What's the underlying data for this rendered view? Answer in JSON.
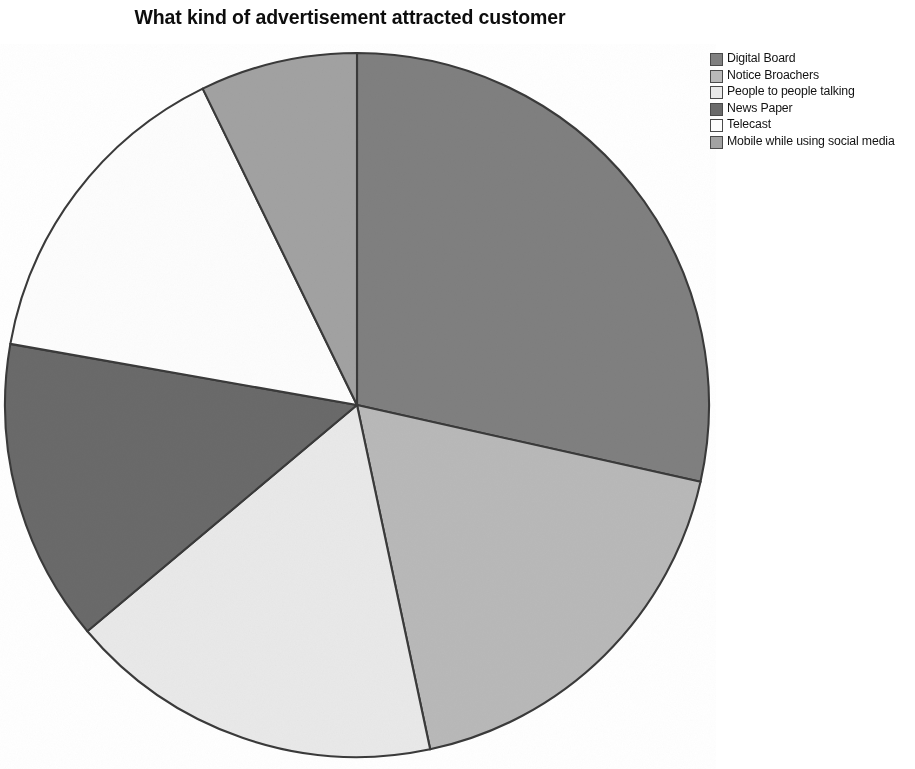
{
  "chart_data": {
    "type": "pie",
    "title": "What kind of advertisement attracted customer",
    "xlabel": "",
    "ylabel": "",
    "legend_position": "right",
    "grid": false,
    "categories": [
      "Digital Board",
      "Notice Broachers",
      "People to people talking",
      "News Paper",
      "Telecast",
      "Mobile while using social media"
    ],
    "values": [
      28.5,
      18.0,
      17.0,
      14.0,
      15.0,
      7.0
    ],
    "slice_colors": [
      "#808080",
      "#b9b9b9",
      "#e9e9e9",
      "#6a6a6a",
      "#fdfdfd",
      "#a2a2a2"
    ],
    "slice_start_angles_deg": [
      0,
      102.6,
      168,
      230,
      280,
      334
    ],
    "slice_sweep_deg": [
      102.6,
      65.4,
      62,
      50,
      54,
      26
    ],
    "stroke_color": "#3a3a3a",
    "background": "#ffffff"
  },
  "legend": {
    "items": [
      {
        "label": "Digital Board",
        "color": "#808080"
      },
      {
        "label": "Notice Broachers",
        "color": "#b9b9b9"
      },
      {
        "label": "People to people talking",
        "color": "#e9e9e9"
      },
      {
        "label": "News Paper",
        "color": "#6a6a6a"
      },
      {
        "label": "Telecast",
        "color": "#fdfdfd"
      },
      {
        "label": "Mobile while using social media",
        "color": "#a2a2a2"
      }
    ]
  }
}
